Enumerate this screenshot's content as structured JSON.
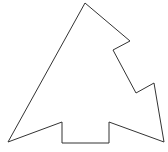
{
  "figure": {
    "width": 168,
    "height": 152,
    "background": "#ffffff",
    "shape": {
      "type": "polygon",
      "stroke": "#333333",
      "stroke_width": 1,
      "fill": "none",
      "points": "85,3 130,41 113,50 136,93 154,83 164,142 109,122 109,143 62,143 62,122 8,142"
    }
  }
}
